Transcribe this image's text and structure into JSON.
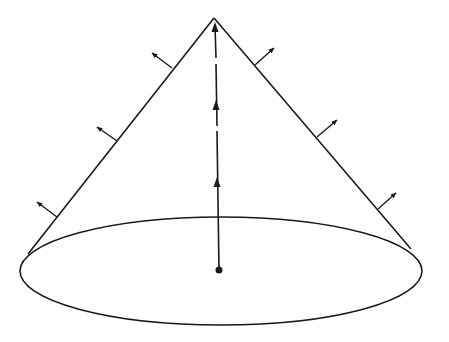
{
  "diagram": {
    "stroke_color": "#1a1a1a",
    "background_color": "#ffffff",
    "apex": {
      "x": 214,
      "y": 18
    },
    "base_ellipse": {
      "cx": 221,
      "cy": 271,
      "rx": 201,
      "ry": 54
    },
    "base_center_dot": {
      "x": 219,
      "y": 270,
      "r": 3.5
    },
    "left_edge": {
      "x1": 214,
      "y1": 18,
      "x2": 28,
      "y2": 254
    },
    "right_edge": {
      "x1": 214,
      "y1": 18,
      "x2": 411,
      "y2": 249
    },
    "axis": {
      "segments": [
        {
          "x1": 219,
          "y1": 270,
          "x2": 217,
          "y2": 131
        },
        {
          "x1": 217,
          "y1": 126,
          "x2": 216,
          "y2": 64
        },
        {
          "x1": 216,
          "y1": 58,
          "x2": 215,
          "y2": 26
        }
      ],
      "arrowheads": [
        {
          "x": 217,
          "y": 177
        },
        {
          "x": 216,
          "y": 100
        },
        {
          "x": 215,
          "y": 22
        }
      ]
    },
    "normal_arrows": [
      {
        "side": "left",
        "x1": 172,
        "y1": 68,
        "x2": 152,
        "y2": 53
      },
      {
        "side": "left",
        "x1": 117,
        "y1": 141,
        "x2": 97,
        "y2": 127
      },
      {
        "side": "left",
        "x1": 57,
        "y1": 217,
        "x2": 37,
        "y2": 202
      },
      {
        "side": "right",
        "x1": 255,
        "y1": 65,
        "x2": 274,
        "y2": 48
      },
      {
        "side": "right",
        "x1": 317,
        "y1": 137,
        "x2": 337,
        "y2": 120
      },
      {
        "side": "right",
        "x1": 378,
        "y1": 209,
        "x2": 396,
        "y2": 193
      }
    ]
  }
}
